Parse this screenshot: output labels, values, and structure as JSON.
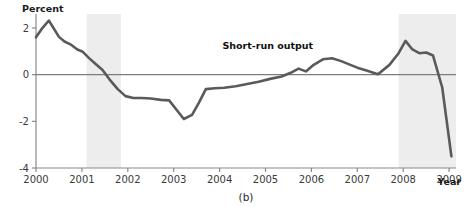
{
  "chart_data": {
    "type": "line",
    "title": "",
    "panel_caption": "(b)",
    "xlabel": "Year",
    "ylabel": "Percent",
    "xlim": [
      2000,
      2009.15
    ],
    "ylim": [
      -4,
      2.6
    ],
    "grid": false,
    "legend_position": "inline-annotation",
    "xticks": [
      "2000",
      "2001",
      "2002",
      "2003",
      "2004",
      "2005",
      "2006",
      "2007",
      "2008",
      "2009"
    ],
    "xtick_values": [
      2000,
      2001,
      2002,
      2003,
      2004,
      2005,
      2006,
      2007,
      2008,
      2009
    ],
    "yticks": [
      "2",
      "0",
      "-2",
      "-4"
    ],
    "ytick_values": [
      2,
      0,
      -2,
      -4
    ],
    "zero_line": 0,
    "series": [
      {
        "name": "Short-run output",
        "color": "#5a5a5a",
        "label_x": 2005.05,
        "label_y": 1.12,
        "x": [
          2000.0,
          2000.12,
          2000.28,
          2000.5,
          2000.62,
          2000.75,
          2000.9,
          2001.02,
          2001.15,
          2001.3,
          2001.45,
          2001.6,
          2001.78,
          2001.95,
          2002.12,
          2002.3,
          2002.5,
          2002.72,
          2002.9,
          2003.1,
          2003.22,
          2003.4,
          2003.55,
          2003.7,
          2003.9,
          2004.1,
          2004.35,
          2004.6,
          2004.85,
          2005.1,
          2005.35,
          2005.55,
          2005.72,
          2005.88,
          2006.05,
          2006.25,
          2006.45,
          2006.65,
          2006.85,
          2007.0,
          2007.2,
          2007.45,
          2007.7,
          2007.9,
          2008.05,
          2008.2,
          2008.35,
          2008.5,
          2008.65,
          2008.85,
          2009.05
        ],
        "y": [
          1.6,
          1.95,
          2.32,
          1.62,
          1.42,
          1.3,
          1.08,
          0.98,
          0.72,
          0.46,
          0.2,
          -0.2,
          -0.62,
          -0.92,
          -1.0,
          -1.0,
          -1.02,
          -1.08,
          -1.1,
          -1.6,
          -1.9,
          -1.72,
          -1.2,
          -0.62,
          -0.58,
          -0.56,
          -0.5,
          -0.4,
          -0.3,
          -0.18,
          -0.08,
          0.08,
          0.26,
          0.14,
          0.42,
          0.66,
          0.7,
          0.58,
          0.42,
          0.3,
          0.18,
          0.02,
          0.42,
          0.92,
          1.45,
          1.08,
          0.92,
          0.95,
          0.82,
          -0.55,
          -3.5
        ]
      }
    ],
    "shaded_bands": [
      {
        "name": "recession-band-2001",
        "x_start": 2001.1,
        "x_end": 2001.85,
        "color": "#ededed"
      },
      {
        "name": "recession-band-2008",
        "x_start": 2007.9,
        "x_end": 2009.15,
        "color": "#ededed"
      }
    ],
    "colors": {
      "line": "#5a5a5a",
      "axis": "#8a8a8a",
      "zero_line": "#7d7d7d",
      "band": "#ededed",
      "text": "#2a2a2a"
    }
  }
}
